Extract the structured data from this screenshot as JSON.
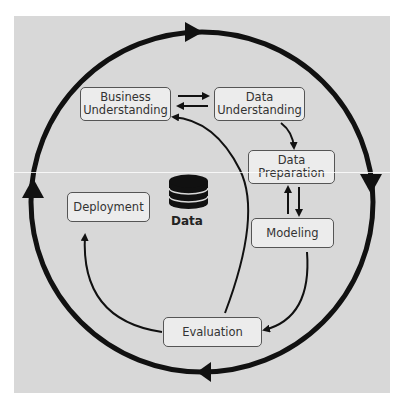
{
  "diagram": {
    "background_color": "#d8d8d8",
    "box_fill": "#ececec",
    "line_color": "#111111",
    "center": {
      "icon": "database-icon",
      "label": "Data"
    },
    "phases": [
      {
        "id": "business",
        "lines": [
          "Business",
          "Understanding"
        ]
      },
      {
        "id": "data_understanding",
        "lines": [
          "Data",
          "Understanding"
        ]
      },
      {
        "id": "data_preparation",
        "lines": [
          "Data",
          "Preparation"
        ]
      },
      {
        "id": "modeling",
        "lines": [
          "Modeling"
        ]
      },
      {
        "id": "evaluation",
        "lines": [
          "Evaluation"
        ]
      },
      {
        "id": "deployment",
        "lines": [
          "Deployment"
        ]
      }
    ],
    "edges": [
      {
        "from": "Business Understanding",
        "to": "Data Understanding"
      },
      {
        "from": "Data Understanding",
        "to": "Business Understanding"
      },
      {
        "from": "Data Understanding",
        "to": "Data Preparation"
      },
      {
        "from": "Data Preparation",
        "to": "Modeling"
      },
      {
        "from": "Modeling",
        "to": "Data Preparation"
      },
      {
        "from": "Modeling",
        "to": "Evaluation"
      },
      {
        "from": "Evaluation",
        "to": "Business Understanding"
      },
      {
        "from": "Evaluation",
        "to": "Deployment"
      }
    ],
    "outer_cycle": "clockwise"
  }
}
